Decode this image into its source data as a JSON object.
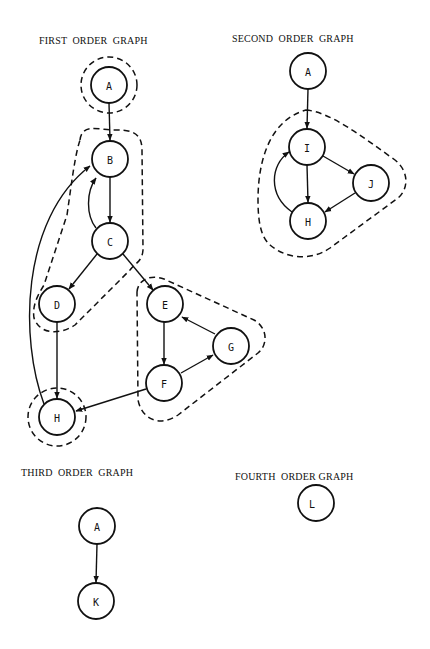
{
  "graphs": {
    "first": {
      "title": "FIRST  ORDER  GRAPH",
      "nodes": [
        {
          "id": "A",
          "label": "A",
          "x": 109,
          "y": 85
        },
        {
          "id": "B",
          "label": "B",
          "x": 110,
          "y": 159
        },
        {
          "id": "C",
          "label": "C",
          "x": 110,
          "y": 241
        },
        {
          "id": "D",
          "label": "D",
          "x": 57,
          "y": 304
        },
        {
          "id": "E",
          "label": "E",
          "x": 165,
          "y": 304
        },
        {
          "id": "G",
          "label": "G",
          "x": 231,
          "y": 346
        },
        {
          "id": "F",
          "label": "F",
          "x": 164,
          "y": 383
        },
        {
          "id": "H",
          "label": "H",
          "x": 57,
          "y": 417
        }
      ],
      "edges": [
        [
          "A",
          "B"
        ],
        [
          "B",
          "C"
        ],
        [
          "C",
          "B"
        ],
        [
          "C",
          "D"
        ],
        [
          "C",
          "E"
        ],
        [
          "D",
          "H"
        ],
        [
          "H",
          "B"
        ],
        [
          "E",
          "F"
        ],
        [
          "F",
          "G"
        ],
        [
          "G",
          "E"
        ],
        [
          "F",
          "H"
        ]
      ],
      "groups": [
        [
          "A"
        ],
        [
          "B",
          "C",
          "D"
        ],
        [
          "E",
          "F",
          "G"
        ],
        [
          "H"
        ]
      ]
    },
    "second": {
      "title": "SECOND  ORDER  GRAPH",
      "nodes": [
        {
          "id": "A",
          "label": "A",
          "x": 308,
          "y": 71
        },
        {
          "id": "I",
          "label": "I",
          "x": 307,
          "y": 147
        },
        {
          "id": "J",
          "label": "J",
          "x": 371,
          "y": 183
        },
        {
          "id": "H",
          "label": "H",
          "x": 308,
          "y": 221
        }
      ],
      "edges": [
        [
          "A",
          "I"
        ],
        [
          "I",
          "H"
        ],
        [
          "I",
          "J"
        ],
        [
          "J",
          "H"
        ],
        [
          "H",
          "I"
        ]
      ],
      "groups": [
        [
          "I",
          "J",
          "H"
        ]
      ]
    },
    "third": {
      "title": "THIRD  ORDER  GRAPH",
      "nodes": [
        {
          "id": "A",
          "label": "A",
          "x": 97,
          "y": 526
        },
        {
          "id": "K",
          "label": "K",
          "x": 96,
          "y": 601
        }
      ],
      "edges": [
        [
          "A",
          "K"
        ]
      ]
    },
    "fourth": {
      "title": "FOURTH  ORDER GRAPH",
      "nodes": [
        {
          "id": "L",
          "label": "L",
          "x": 316,
          "y": 503
        }
      ],
      "edges": []
    }
  }
}
